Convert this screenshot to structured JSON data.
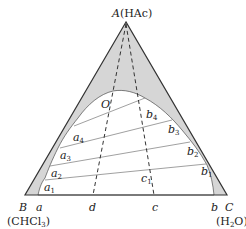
{
  "colors": {
    "shade": "#d6d6d6",
    "stroke": "#333333",
    "tie": "#888888",
    "background": "#ffffff"
  },
  "vertices": {
    "A": {
      "letter": "A",
      "compound": "(HAc)"
    },
    "B": {
      "letter": "B",
      "compound": "(CHCl",
      "compound_sub": "3",
      "compound_end": ")"
    },
    "C": {
      "letter": "C",
      "compound": "(H",
      "compound_sub": "2",
      "compound_end": "O)"
    }
  },
  "points": {
    "O": "O",
    "a": "a",
    "b": "b",
    "c": "c",
    "d": "d",
    "c1": {
      "base": "c",
      "sub": "1"
    }
  },
  "raffinate_points": [
    {
      "base": "a",
      "sub": "1"
    },
    {
      "base": "a",
      "sub": "2"
    },
    {
      "base": "a",
      "sub": "3"
    },
    {
      "base": "a",
      "sub": "4"
    }
  ],
  "extract_points": [
    {
      "base": "b",
      "sub": "1"
    },
    {
      "base": "b",
      "sub": "2"
    },
    {
      "base": "b",
      "sub": "3"
    },
    {
      "base": "b",
      "sub": "4"
    }
  ],
  "tie_lines": [
    "a1-b1",
    "a2-b2",
    "a3-b3",
    "a4-b4"
  ],
  "dashed_lines": [
    "A-d",
    "A-c"
  ]
}
